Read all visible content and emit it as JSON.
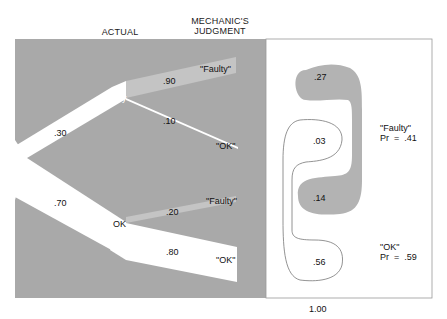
{
  "headers": {
    "actual": "ACTUAL",
    "judgment_line1": "MECHANIC'S",
    "judgment_line2": "JUDGMENT"
  },
  "tree": {
    "actual_faulty": {
      "label": "Faulty",
      "prob": ".30"
    },
    "actual_ok": {
      "label": "OK",
      "prob": ".70"
    },
    "faulty_says_faulty": {
      "label": "\"Faulty\"",
      "prob": ".90"
    },
    "faulty_says_ok": {
      "label": "\"OK\"",
      "prob": ".10"
    },
    "ok_says_faulty": {
      "label": "\"Faulty\"",
      "prob": ".20"
    },
    "ok_says_ok": {
      "label": "\"OK\"",
      "prob": ".80"
    }
  },
  "outcomes": {
    "ff": ".27",
    "fo": ".03",
    "of": ".14",
    "oo": ".56",
    "faulty_total": {
      "label": "\"Faulty\"",
      "pr": "Pr  =  .41"
    },
    "ok_total": {
      "label": "\"OK\"",
      "pr": "Pr  =  .59"
    },
    "total": "1.00"
  },
  "colors": {
    "background_gray": "#a9a9a9",
    "band_light_gray": "#c4c4c4",
    "blob_gray": "#b3b3b3",
    "white": "#ffffff",
    "outline": "#777777"
  }
}
